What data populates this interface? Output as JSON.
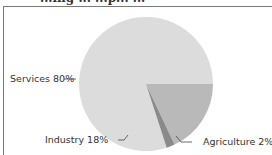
{
  "title": "...ing ... ...p... ...",
  "chart_data": {
    "type": "pie",
    "title": "",
    "categories": [
      "Services",
      "Industry",
      "Agriculture"
    ],
    "values": [
      80,
      18,
      2
    ],
    "labels": [
      "Services 80%",
      "Industry 18%",
      "Agriculture 2%"
    ],
    "colors": [
      "#dcdcdc",
      "#b9b9b9",
      "#8a8a8a"
    ],
    "legend": "none (leader-line labels)"
  },
  "labels": {
    "services": "Services 80%",
    "industry": "Industry 18%",
    "agriculture": "Agriculture 2%"
  }
}
